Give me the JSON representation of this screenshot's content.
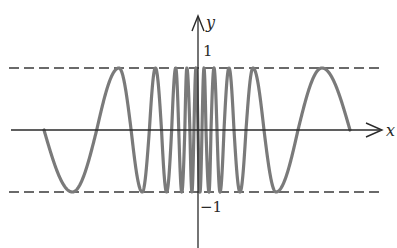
{
  "chart_data": {
    "type": "line",
    "title": "",
    "xlabel": "x",
    "ylabel": "y",
    "ylim": [
      -1,
      1
    ],
    "tick_labels": {
      "y_top": "1",
      "y_bottom": "−1"
    },
    "reference_lines": [
      {
        "y": 1,
        "style": "dashed"
      },
      {
        "y": -1,
        "style": "dashed"
      }
    ],
    "series": [
      {
        "name": "curve",
        "color": "#7a7a7a",
        "phase_anchors_right": [
          [
            152,
            0
          ],
          [
            124,
            1
          ],
          [
            100,
            2
          ],
          [
            78,
            3
          ],
          [
            66,
            4
          ],
          [
            55,
            5
          ],
          [
            48,
            6
          ],
          [
            42,
            7
          ],
          [
            36,
            8
          ],
          [
            31,
            9
          ],
          [
            26,
            10
          ],
          [
            22,
            11
          ],
          [
            19,
            12
          ],
          [
            16,
            13
          ],
          [
            13,
            14
          ],
          [
            11,
            15
          ],
          [
            8,
            16
          ],
          [
            6,
            17
          ],
          [
            4,
            18
          ],
          [
            2,
            19
          ],
          [
            0,
            20
          ]
        ],
        "left_extent_px": 154,
        "right_extent_px": 152
      }
    ]
  },
  "labels": {
    "x_axis": "x",
    "y_axis": "y",
    "y_tick_1": "1",
    "y_tick_minus1": "−1"
  },
  "colors": {
    "curve": "#7a7a7a",
    "axis": "#2a2a2a",
    "dashed": "#3a3a3a"
  }
}
